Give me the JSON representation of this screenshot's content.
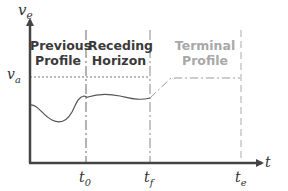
{
  "diagram": {
    "type": "velocity-time profile",
    "axes": {
      "y_label": "v",
      "y_label_sub": "e",
      "x_label": "t"
    },
    "reference_level": {
      "label": "v",
      "label_sub": "a"
    },
    "time_marks": [
      {
        "label": "t",
        "sub": "0"
      },
      {
        "label": "t",
        "sub": "f"
      },
      {
        "label": "t",
        "sub": "e"
      }
    ],
    "regions": [
      {
        "line1": "Previous",
        "line2": "Profile",
        "color": "#3a3a3a"
      },
      {
        "line1": "Receding",
        "line2": "Horizon",
        "color": "#3a3a3a"
      },
      {
        "line1": "Terminal",
        "line2": "Profile",
        "color": "#a8a8a8"
      }
    ],
    "colors": {
      "axis": "#444444",
      "curve": "#555555",
      "terminal": "#a8a8a8",
      "dashed": "#666666"
    }
  }
}
